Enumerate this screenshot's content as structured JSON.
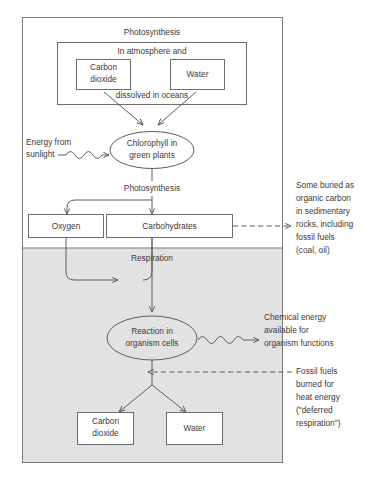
{
  "figure": {
    "title_top": "Photosynthesis",
    "title_bottom": "Respiration"
  },
  "upper": {
    "reservoir_top_label": "In atmosphere and",
    "reservoir_bottom_label": "dissolved in oceans",
    "carbon_dioxide": {
      "line1": "Carbon",
      "line2": "dioxide"
    },
    "water": "Water",
    "energy_label": {
      "line1": "Energy from",
      "line2": "sunlight"
    },
    "chlorophyll": {
      "line1": "Chlorophyll in",
      "line2": "green plants"
    },
    "process_label": "Photosynthesis",
    "oxygen": "Oxygen",
    "carbohydrates": "Carbohydrates"
  },
  "lower": {
    "reaction": {
      "line1": "Reaction in",
      "line2": "organism cells"
    },
    "carbon_dioxide": {
      "line1": "Carbon",
      "line2": "dioxide"
    },
    "water": "Water"
  },
  "annotations": {
    "burial": [
      "Some buried as",
      "organic carbon",
      "in sedimentary",
      "rocks, including",
      "fossil fuels",
      "(coal, oil)"
    ],
    "chemical_energy": [
      "Chemical energy",
      "available for",
      "organism functions"
    ],
    "fossil_burn": [
      "Fossil fuels",
      "burned for",
      "heat energy",
      "(\"deferred",
      "respiration\")"
    ]
  },
  "colors": {
    "shade": "#e2e2e2",
    "stroke": "#5d5d5d",
    "frame": "#7a7a7a",
    "text": "#3a3a3a",
    "background": "#ffffff"
  }
}
